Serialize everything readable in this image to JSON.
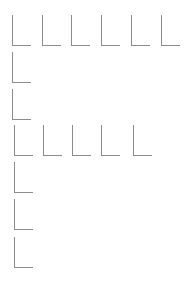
{
  "style": {
    "stroke_color": "#8c8c8c",
    "background": "#ffffff"
  },
  "corner_size": {
    "width": 19,
    "height": 31
  },
  "rows": [
    {
      "y": 15,
      "xs": [
        12,
        42,
        71,
        101,
        131,
        161
      ]
    },
    {
      "y": 52,
      "xs": [
        12
      ]
    },
    {
      "y": 89,
      "xs": [
        12
      ]
    },
    {
      "y": 125,
      "xs": [
        14,
        43,
        72,
        101,
        133
      ]
    },
    {
      "y": 162,
      "xs": [
        14
      ]
    },
    {
      "y": 199,
      "xs": [
        14
      ]
    },
    {
      "y": 237,
      "xs": [
        14
      ]
    }
  ]
}
